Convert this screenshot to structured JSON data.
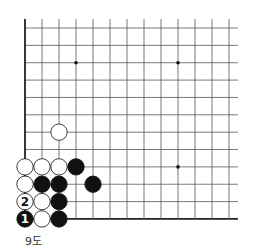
{
  "diagram": {
    "caption": "9도",
    "board": {
      "origin_x": 25,
      "origin_y": 28,
      "spacing": 17.36,
      "cols": 13,
      "rows": 12,
      "line_top": 19,
      "line_right": 238,
      "line_color": "#555555",
      "edge_color": "#222222",
      "star_points": [
        [
          3,
          2
        ],
        [
          9,
          2
        ],
        [
          9,
          8
        ]
      ]
    },
    "stones": [
      {
        "color": "white",
        "col": 2,
        "row": 6,
        "label": ""
      },
      {
        "color": "white",
        "col": 0,
        "row": 8,
        "label": ""
      },
      {
        "color": "white",
        "col": 1,
        "row": 8,
        "label": ""
      },
      {
        "color": "white",
        "col": 2,
        "row": 8,
        "label": ""
      },
      {
        "color": "black",
        "col": 3,
        "row": 8,
        "label": ""
      },
      {
        "color": "white",
        "col": 0,
        "row": 9,
        "label": ""
      },
      {
        "color": "black",
        "col": 1,
        "row": 9,
        "label": ""
      },
      {
        "color": "black",
        "col": 2,
        "row": 9,
        "label": ""
      },
      {
        "color": "black",
        "col": 4,
        "row": 9,
        "label": ""
      },
      {
        "color": "white",
        "col": 0,
        "row": 10,
        "label": "2"
      },
      {
        "color": "white",
        "col": 1,
        "row": 10,
        "label": ""
      },
      {
        "color": "black",
        "col": 2,
        "row": 10,
        "label": ""
      },
      {
        "color": "black",
        "col": 0,
        "row": 11,
        "label": "1"
      },
      {
        "color": "white",
        "col": 1,
        "row": 11,
        "label": ""
      },
      {
        "color": "black",
        "col": 2,
        "row": 11,
        "label": ""
      }
    ]
  }
}
